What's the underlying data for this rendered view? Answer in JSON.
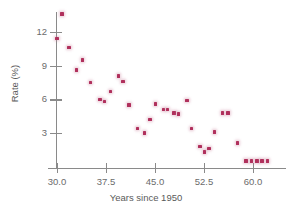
{
  "chart_data": {
    "type": "scatter",
    "title": "",
    "xlabel": "Years since 1950",
    "ylabel": "Rate (%)",
    "xlim": [
      28.5,
      63.5
    ],
    "ylim": [
      0.0,
      14.5
    ],
    "grid": false,
    "legend": null,
    "marker_color": "#b0305c",
    "axis_color": "#8a8a8a",
    "xticks": [
      30.0,
      37.5,
      45.0,
      52.5,
      60.0
    ],
    "xtick_labels": [
      "30.0",
      "37.5",
      "45.0",
      "52.5",
      "60.0"
    ],
    "yticks": [
      3,
      6,
      9,
      12
    ],
    "ytick_labels": [
      "3",
      "6",
      "9",
      "12"
    ],
    "series": [
      {
        "name": "Rate",
        "points": [
          {
            "x": 30.0,
            "y": 11.4
          },
          {
            "x": 30.8,
            "y": 13.6
          },
          {
            "x": 31.8,
            "y": 10.6
          },
          {
            "x": 33.0,
            "y": 8.6
          },
          {
            "x": 33.9,
            "y": 9.5
          },
          {
            "x": 35.1,
            "y": 7.5
          },
          {
            "x": 36.6,
            "y": 6.0
          },
          {
            "x": 37.3,
            "y": 5.8
          },
          {
            "x": 38.2,
            "y": 6.7
          },
          {
            "x": 39.4,
            "y": 8.1
          },
          {
            "x": 40.1,
            "y": 7.6
          },
          {
            "x": 41.0,
            "y": 5.5
          },
          {
            "x": 42.3,
            "y": 3.4
          },
          {
            "x": 43.4,
            "y": 3.0
          },
          {
            "x": 44.2,
            "y": 4.2
          },
          {
            "x": 45.1,
            "y": 5.6
          },
          {
            "x": 46.3,
            "y": 5.1
          },
          {
            "x": 46.9,
            "y": 5.1
          },
          {
            "x": 47.9,
            "y": 4.8
          },
          {
            "x": 48.6,
            "y": 4.7
          },
          {
            "x": 49.9,
            "y": 5.9
          },
          {
            "x": 50.6,
            "y": 3.4
          },
          {
            "x": 51.9,
            "y": 1.8
          },
          {
            "x": 52.6,
            "y": 1.3
          },
          {
            "x": 53.3,
            "y": 1.6
          },
          {
            "x": 54.1,
            "y": 3.1
          },
          {
            "x": 55.3,
            "y": 4.8
          },
          {
            "x": 56.2,
            "y": 4.8
          },
          {
            "x": 57.6,
            "y": 2.1
          },
          {
            "x": 58.9,
            "y": 0.5
          },
          {
            "x": 59.8,
            "y": 0.5
          },
          {
            "x": 60.6,
            "y": 0.5
          },
          {
            "x": 61.4,
            "y": 0.5
          },
          {
            "x": 62.2,
            "y": 0.5
          }
        ]
      }
    ]
  }
}
